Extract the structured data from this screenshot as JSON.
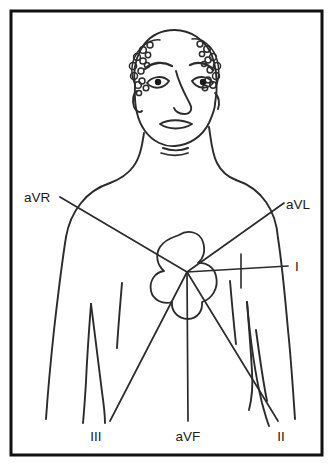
{
  "figure": {
    "background_color": "#ffffff",
    "ink_color": "#1a1a1a",
    "border": {
      "name": "figure-border",
      "x": 11,
      "y": 11,
      "width": 311,
      "height": 444,
      "stroke_width": 3,
      "color": "#111111"
    }
  },
  "subject": {
    "name": "patient-torso-illustration",
    "description": "Front view line drawing of a bald man, head, neck, shoulders, arms and upper torso"
  },
  "heart": {
    "name": "heart-outline",
    "center_x": 187,
    "center_y": 272,
    "description": "Lobed cloverleaf heart outline in center of chest"
  },
  "leads": [
    {
      "id": "aVR",
      "label": "aVR",
      "label_x": 24,
      "label_y": 202,
      "anchor": "start",
      "line": {
        "x1": 60,
        "y1": 197,
        "x2": 187,
        "y2": 272
      },
      "name": "lead-axis-avr"
    },
    {
      "id": "aVL",
      "label": "aVL",
      "label_x": 286,
      "label_y": 209,
      "anchor": "start",
      "line": {
        "x1": 187,
        "y1": 272,
        "x2": 284,
        "y2": 203
      },
      "name": "lead-axis-avl"
    },
    {
      "id": "I",
      "label": "I",
      "label_x": 295,
      "label_y": 271,
      "anchor": "start",
      "line": {
        "x1": 187,
        "y1": 272,
        "x2": 288,
        "y2": 266
      },
      "name": "lead-axis-i"
    },
    {
      "id": "III",
      "label": "III",
      "label_x": 96,
      "label_y": 441,
      "anchor": "middle",
      "line": {
        "x1": 187,
        "y1": 272,
        "x2": 110,
        "y2": 421
      },
      "name": "lead-axis-iii"
    },
    {
      "id": "aVF",
      "label": "aVF",
      "label_x": 188,
      "label_y": 441,
      "anchor": "middle",
      "line": {
        "x1": 187,
        "y1": 272,
        "x2": 188,
        "y2": 421
      },
      "name": "lead-axis-avf"
    },
    {
      "id": "II",
      "label": "II",
      "label_x": 281,
      "label_y": 441,
      "anchor": "middle",
      "line": {
        "x1": 187,
        "y1": 272,
        "x2": 278,
        "y2": 421
      },
      "name": "lead-axis-ii"
    }
  ]
}
